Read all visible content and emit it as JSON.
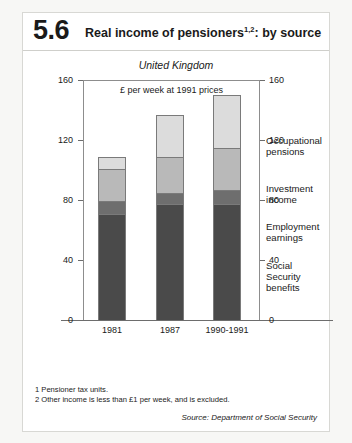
{
  "header": {
    "number": "5.6",
    "title_main": "Real income of pensioners",
    "title_sup": "1,2",
    "title_tail": ": by source"
  },
  "region_label": "United Kingdom",
  "footnotes": [
    "1  Pensioner tax units.",
    "2  Other income is less than £1 per week, and is excluded."
  ],
  "source": "Source: Department of Social Security",
  "chart_data": {
    "type": "bar",
    "subtype": "stacked-vertical",
    "title": "Real income of pensioners1,2: by source",
    "subtitle": "£ per week at 1991 prices",
    "region": "United Kingdom",
    "categories": [
      "1981",
      "1987",
      "1990-1991"
    ],
    "series": [
      {
        "name": "Social Security benefits",
        "values": [
          70,
          77,
          77
        ],
        "color": "#4a4a4a"
      },
      {
        "name": "Employment earnings",
        "values": [
          9,
          7,
          9
        ],
        "color": "#6e6e6e"
      },
      {
        "name": "Investment income",
        "values": [
          21,
          24,
          28
        ],
        "color": "#b9b9b9"
      },
      {
        "name": "Occupational pensions",
        "values": [
          9,
          29,
          36
        ],
        "color": "#dcdcdc"
      }
    ],
    "totals": [
      109,
      137,
      150
    ],
    "xlabel": "",
    "ylabel": "£ per week at 1991 prices",
    "ylim": [
      0,
      160
    ],
    "yticks": [
      0,
      40,
      80,
      120,
      160
    ],
    "ytick_labels_left": [
      "0",
      "40",
      "80",
      "120",
      "160"
    ],
    "ytick_labels_right": [
      "0",
      "40",
      "80",
      "120",
      "160"
    ],
    "grid": false,
    "legend_position": "right-inline",
    "legend_entries": [
      "Occupational pensions",
      "Investment income",
      "Employment earnings",
      "Social Security benefits"
    ]
  }
}
